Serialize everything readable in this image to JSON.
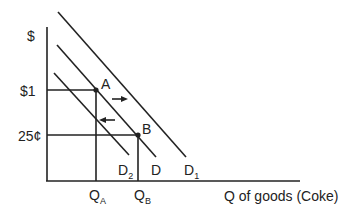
{
  "diagram": {
    "type": "supply-demand",
    "y_axis_label": "$",
    "x_axis_label": "Q of goods (Coke)",
    "price_labels": {
      "high": "$1",
      "low": "25¢"
    },
    "points": {
      "a": "A",
      "b": "B"
    },
    "quantity_labels": {
      "qa_main": "Q",
      "qa_sub": "A",
      "qb_main": "Q",
      "qb_sub": "B"
    },
    "curves": {
      "d": "D",
      "d1_main": "D",
      "d1_sub": "1",
      "d2_main": "D",
      "d2_sub": "2"
    },
    "arrows": [
      {
        "name": "shift-right",
        "direction": "right",
        "meaning": "D to D1"
      },
      {
        "name": "shift-left",
        "direction": "left",
        "meaning": "D to D2"
      }
    ],
    "colors": {
      "line": "#222222",
      "background": "#ffffff"
    }
  }
}
